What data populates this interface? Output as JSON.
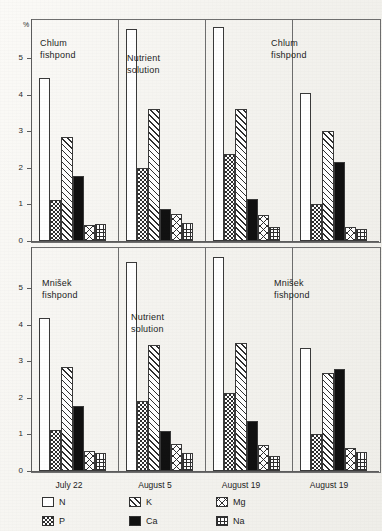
{
  "chart_data": {
    "type": "bar",
    "title": "",
    "subtitle": "",
    "xlabel": "",
    "ylabel": "%",
    "ylim": [
      0,
      6
    ],
    "yticks": [
      0,
      1,
      2,
      3,
      4,
      5
    ],
    "ytick_labels": [
      "0",
      "1",
      "2",
      "3",
      "4",
      "5"
    ],
    "grid": false,
    "legend_position": "bottom",
    "categories": [
      "July 22",
      "August 5",
      "August 19",
      "August 19"
    ],
    "series": [
      {
        "name": "N",
        "pattern": "white",
        "values_top": [
          4.45,
          5.8,
          5.85,
          4.05
        ],
        "values_bottom": [
          4.18,
          5.7,
          5.85,
          3.37
        ]
      },
      {
        "name": "P",
        "pattern": "stipple",
        "values_top": [
          1.12,
          2.0,
          2.38,
          1.0
        ],
        "values_bottom": [
          1.12,
          1.92,
          2.12,
          1.02
        ]
      },
      {
        "name": "K",
        "pattern": "diagonal",
        "values_top": [
          2.85,
          3.6,
          3.62,
          3.01
        ],
        "values_bottom": [
          2.85,
          3.44,
          3.5,
          2.67
        ]
      },
      {
        "name": "Ca",
        "pattern": "solid-black",
        "values_top": [
          1.78,
          0.87,
          1.14,
          2.15
        ],
        "values_bottom": [
          1.78,
          1.1,
          1.36,
          2.8
        ]
      },
      {
        "name": "Mg",
        "pattern": "cross-hatch",
        "values_top": [
          0.43,
          0.73,
          0.71,
          0.39
        ],
        "values_bottom": [
          0.55,
          0.73,
          0.71,
          0.62
        ]
      },
      {
        "name": "Na",
        "pattern": "grid",
        "values_top": [
          0.46,
          0.5,
          0.38,
          0.34
        ],
        "values_bottom": [
          0.48,
          0.48,
          0.42,
          0.52
        ]
      }
    ],
    "panels": [
      {
        "id": "top",
        "annotations": [
          "Chlum\nfishpond",
          "Nutrient\nsolution",
          "",
          "Chlum\nfishpond"
        ],
        "annotation_group_index": [
          0,
          1,
          2,
          3
        ]
      },
      {
        "id": "bottom",
        "annotations": [
          "Mnišek\nfishpond",
          "Nutrient\nsolution",
          "",
          "Mnišek\nfishpond"
        ],
        "annotation_group_index": [
          0,
          1,
          2,
          3
        ]
      }
    ]
  },
  "axis": {
    "unit_label": "%",
    "tick_0": "0",
    "tick_1": "1",
    "tick_2": "2",
    "tick_3": "3",
    "tick_4": "4",
    "tick_5": "5"
  },
  "panel_top": {
    "label_group1": "Chlum\nfishpond",
    "label_group2": "Nutrient\nsolution",
    "label_group4": "Chlum\nfishpond"
  },
  "panel_bottom": {
    "label_group1": "Mnišek\nfishpond",
    "label_group2": "Nutrient\nsolution",
    "label_group4": "Mnišek\nfishpond"
  },
  "xaxis": {
    "cat0": "July 22",
    "cat1": "August 5",
    "cat2": "August 19",
    "cat3": "August 19"
  },
  "legend": {
    "n": "N",
    "p": "P",
    "k": "K",
    "ca": "Ca",
    "mg": "Mg",
    "na": "Na"
  }
}
